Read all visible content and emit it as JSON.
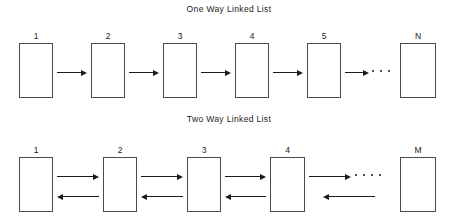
{
  "canvas": {
    "width": 458,
    "height": 224,
    "background": "#ffffff",
    "stroke": "#4a4a4a",
    "arrow_color": "#1a1a1a"
  },
  "diagrams": [
    {
      "id": "one-way-linked-list",
      "title": "One Way Linked List",
      "direction": "single",
      "nodes": [
        {
          "label": "1",
          "x": 19,
          "y": 43,
          "w": 34,
          "h": 55
        },
        {
          "label": "2",
          "x": 91,
          "y": 43,
          "w": 34,
          "h": 55
        },
        {
          "label": "3",
          "x": 163,
          "y": 43,
          "w": 34,
          "h": 55
        },
        {
          "label": "4",
          "x": 235,
          "y": 43,
          "w": 34,
          "h": 55
        },
        {
          "label": "5",
          "x": 307,
          "y": 43,
          "w": 34,
          "h": 55
        },
        {
          "label": "N",
          "x": 400,
          "y": 43,
          "w": 36,
          "h": 55
        }
      ],
      "forward_arrows": [
        {
          "x": 57,
          "y": 69,
          "w": 30
        },
        {
          "x": 129,
          "y": 69,
          "w": 30
        },
        {
          "x": 201,
          "y": 69,
          "w": 30
        },
        {
          "x": 273,
          "y": 69,
          "w": 30
        },
        {
          "x": 345,
          "y": 69,
          "w": 24
        }
      ],
      "backward_arrows": [],
      "ellipsis": {
        "x": 372,
        "y": 70,
        "dots": 3,
        "gap": 8
      }
    },
    {
      "id": "two-way-linked-list",
      "title": "Two Way Linked List",
      "direction": "double",
      "nodes": [
        {
          "label": "1",
          "x": 19,
          "y": 157,
          "w": 34,
          "h": 55
        },
        {
          "label": "2",
          "x": 103,
          "y": 157,
          "w": 34,
          "h": 55
        },
        {
          "label": "3",
          "x": 187,
          "y": 157,
          "w": 34,
          "h": 55
        },
        {
          "label": "4",
          "x": 270,
          "y": 157,
          "w": 35,
          "h": 55
        },
        {
          "label": "M",
          "x": 400,
          "y": 157,
          "w": 36,
          "h": 55
        }
      ],
      "forward_arrows": [
        {
          "x": 57,
          "y": 173,
          "w": 42
        },
        {
          "x": 141,
          "y": 173,
          "w": 42
        },
        {
          "x": 225,
          "y": 173,
          "w": 41
        },
        {
          "x": 309,
          "y": 173,
          "w": 42
        }
      ],
      "backward_arrows": [
        {
          "x": 57,
          "y": 193,
          "w": 42
        },
        {
          "x": 141,
          "y": 193,
          "w": 42
        },
        {
          "x": 225,
          "y": 193,
          "w": 41
        },
        {
          "x": 323,
          "y": 193,
          "w": 52
        }
      ],
      "ellipsis": {
        "x": 355,
        "y": 174,
        "dots": 4,
        "gap": 8
      }
    }
  ]
}
